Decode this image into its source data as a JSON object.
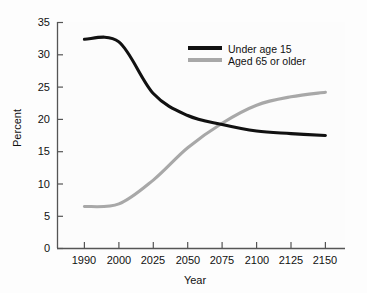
{
  "chart_data": {
    "type": "line",
    "title": "",
    "xlabel": "Year",
    "ylabel": "Percent",
    "xticklabels": [
      "1990",
      "2000",
      "2025",
      "2050",
      "2075",
      "2100",
      "2125",
      "2150"
    ],
    "yticklabels": [
      "0",
      "5",
      "10",
      "15",
      "20",
      "25",
      "30",
      "35"
    ],
    "ylim": [
      0,
      35
    ],
    "grid": false,
    "legend_position": "upper right",
    "categories": [
      "1990",
      "2000",
      "2025",
      "2050",
      "2075",
      "2100",
      "2125",
      "2150"
    ],
    "series": [
      {
        "name": "Under age 15",
        "color": "#111111",
        "values": [
          32.4,
          32.0,
          24.0,
          20.6,
          19.2,
          18.2,
          17.8,
          17.5
        ]
      },
      {
        "name": "Aged 65 or older",
        "color": "#a8a8a8",
        "values": [
          6.5,
          6.9,
          10.6,
          15.6,
          19.4,
          22.2,
          23.5,
          24.2
        ]
      }
    ]
  },
  "axes": {
    "ylabel": "Percent",
    "xlabel": "Year",
    "yticks": [
      "35",
      "30",
      "25",
      "20",
      "15",
      "10",
      "5",
      "0"
    ],
    "xticks": [
      "1990",
      "2000",
      "2025",
      "2050",
      "2075",
      "2100",
      "2125",
      "2150"
    ]
  },
  "legend": {
    "items": [
      {
        "label": "Under age 15",
        "color": "#111111"
      },
      {
        "label": "Aged 65 or older",
        "color": "#a8a8a8"
      }
    ]
  },
  "colors": {
    "series_black": "#111111",
    "series_gray": "#a8a8a8",
    "axis": "#555555",
    "background": "#fdfdfd",
    "text": "#111111"
  }
}
